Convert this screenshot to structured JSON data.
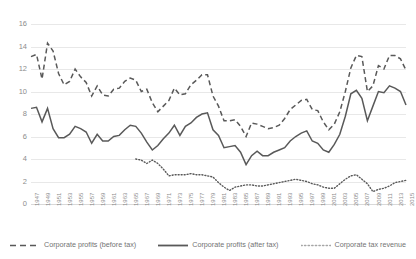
{
  "chart_data": {
    "type": "line",
    "title": "",
    "xlabel": "",
    "ylabel": "",
    "ylim": [
      0,
      16
    ],
    "ytick_step": 2,
    "yticks": [
      "16",
      "14",
      "12",
      "10",
      "8",
      "6",
      "4",
      "2",
      "0"
    ],
    "grid": true,
    "legend_position": "bottom",
    "x": [
      1947,
      1948,
      1949,
      1950,
      1951,
      1952,
      1953,
      1954,
      1955,
      1956,
      1957,
      1958,
      1959,
      1960,
      1961,
      1962,
      1963,
      1964,
      1965,
      1966,
      1967,
      1968,
      1969,
      1970,
      1971,
      1972,
      1973,
      1974,
      1975,
      1976,
      1977,
      1978,
      1979,
      1980,
      1981,
      1982,
      1983,
      1984,
      1985,
      1986,
      1987,
      1988,
      1989,
      1990,
      1991,
      1992,
      1993,
      1994,
      1995,
      1996,
      1997,
      1998,
      1999,
      2000,
      2001,
      2002,
      2003,
      2004,
      2005,
      2006,
      2007,
      2008,
      2009,
      2010,
      2011,
      2012,
      2013,
      2014,
      2015
    ],
    "xtick_labels": [
      "1947",
      "1949",
      "1951",
      "1953",
      "1955",
      "1957",
      "1959",
      "1961",
      "1963",
      "1965",
      "1967",
      "1969",
      "1971",
      "1973",
      "1975",
      "1977",
      "1979",
      "1981",
      "1983",
      "1985",
      "1987",
      "1989",
      "1991",
      "1993",
      "1995",
      "1997",
      "1999",
      "2001",
      "2003",
      "2005",
      "2007",
      "2009",
      "2011",
      "2013",
      "2015"
    ],
    "series": [
      {
        "name": "Corporate profits (before tax)",
        "style": "dashed",
        "color": "#595959",
        "values": [
          13.1,
          13.3,
          11.1,
          14.3,
          13.6,
          11.6,
          10.6,
          10.9,
          12.0,
          11.3,
          10.8,
          9.6,
          10.5,
          9.7,
          9.6,
          10.2,
          10.3,
          10.9,
          11.2,
          11.0,
          10.0,
          10.2,
          9.0,
          8.2,
          8.7,
          9.2,
          10.3,
          9.7,
          9.8,
          10.6,
          11.0,
          11.5,
          11.5,
          9.6,
          8.7,
          7.4,
          7.4,
          7.5,
          6.9,
          6.0,
          7.2,
          7.1,
          6.9,
          6.7,
          6.8,
          7.0,
          7.6,
          8.4,
          8.8,
          9.2,
          9.3,
          8.4,
          8.3,
          7.3,
          6.6,
          7.1,
          8.2,
          10.0,
          12.1,
          13.2,
          13.1,
          10.0,
          10.5,
          12.3,
          12.0,
          13.2,
          13.2,
          12.9,
          11.9
        ]
      },
      {
        "name": "Corporate profits (after tax)",
        "style": "solid",
        "color": "#595959",
        "values": [
          8.5,
          8.6,
          7.3,
          8.5,
          6.7,
          5.9,
          5.9,
          6.2,
          6.9,
          6.7,
          6.4,
          5.4,
          6.2,
          5.6,
          5.6,
          6.0,
          6.1,
          6.6,
          7.0,
          6.9,
          6.3,
          5.5,
          4.8,
          5.2,
          5.8,
          6.3,
          7.0,
          6.1,
          6.9,
          7.2,
          7.7,
          8.0,
          8.1,
          6.6,
          6.1,
          5.0,
          5.1,
          5.2,
          4.6,
          3.5,
          4.3,
          4.7,
          4.3,
          4.3,
          4.6,
          4.8,
          5.0,
          5.6,
          6.0,
          6.3,
          6.5,
          5.6,
          5.4,
          4.8,
          4.6,
          5.3,
          6.2,
          7.8,
          9.8,
          10.1,
          9.4,
          7.4,
          8.7,
          10.0,
          9.9,
          10.5,
          10.3,
          10.0,
          8.8
        ]
      },
      {
        "name": "Corporate tax revenue",
        "style": "dotted",
        "color": "#a6a6a6",
        "start_year": 1966,
        "values": [
          null,
          null,
          null,
          null,
          null,
          null,
          null,
          null,
          null,
          null,
          null,
          null,
          null,
          null,
          null,
          null,
          null,
          null,
          null,
          4.0,
          3.9,
          3.6,
          3.9,
          3.6,
          3.1,
          2.5,
          2.6,
          2.6,
          2.6,
          2.7,
          2.6,
          2.6,
          2.5,
          2.4,
          1.9,
          1.5,
          1.2,
          1.5,
          1.6,
          1.7,
          1.7,
          1.6,
          1.6,
          1.7,
          1.8,
          1.9,
          2.0,
          2.1,
          2.2,
          2.1,
          2.0,
          1.8,
          1.7,
          1.5,
          1.4,
          1.4,
          1.8,
          2.2,
          2.5,
          2.6,
          2.2,
          1.8,
          1.1,
          1.3,
          1.4,
          1.6,
          1.9,
          2.0,
          2.1
        ]
      }
    ]
  }
}
